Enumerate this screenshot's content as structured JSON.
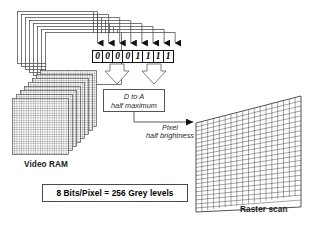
{
  "figure": {
    "background_color": "#ffffff",
    "line_color": "#333333",
    "text_color": "#1a1a1a"
  },
  "bit_register": {
    "name": "8-bit pixel value register",
    "bits": [
      "0",
      "0",
      "0",
      "0",
      "1",
      "1",
      "1",
      "1"
    ],
    "bit_count": 8
  },
  "converter": {
    "line1": "D to A",
    "line2": "half maximum"
  },
  "signal": {
    "line1": "Pixel",
    "line2": "half brightness"
  },
  "labels": {
    "video_ram": "Video RAM",
    "raster_scan": "Raster scan"
  },
  "caption": {
    "text": "8 Bits/Pixel = 256 Grey levels"
  },
  "planes": {
    "count": 8,
    "note": "stacked bit planes"
  },
  "screen": {
    "columns": 18,
    "rows": 22
  }
}
